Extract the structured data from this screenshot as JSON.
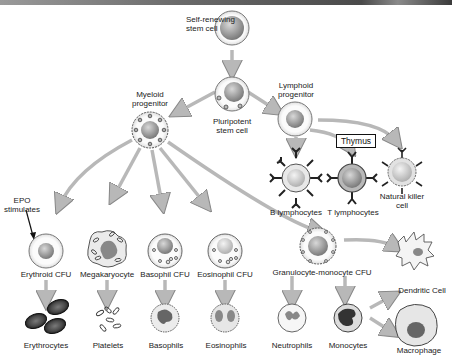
{
  "diagram": {
    "nodes": {
      "self_renewing": "Self-renewing\nstem cell",
      "pluripotent": "Pluripotent\nstem cell",
      "myeloid": "Myeloid\nprogenitor",
      "lymphoid": "Lymphoid\nprogenitor",
      "thymus": "Thymus",
      "b_lymph": "B lymphocytes",
      "t_lymph": "T lymphocytes",
      "nk": "Natural killer\ncell",
      "epo": "EPO\nstimulates",
      "erythroid_cfu": "Erythroid CFU",
      "megakaryocyte": "Megakaryocyte",
      "basophil_cfu": "Basophil CFU",
      "eosinophil_cfu": "Eosinophil CFU",
      "gm_cfu": "Granulocyte-monocyte CFU",
      "dendritic": "Dendritic Cell",
      "macrophage": "Macrophage",
      "erythrocytes": "Erythrocytes",
      "platelets": "Platelets",
      "basophils": "Basophils",
      "eosinophils": "Eosinophils",
      "neutrophils": "Neutrophils",
      "monocytes": "Monocytes"
    },
    "labels_split": {
      "self_renewing": [
        "Self-renewing",
        "stem cell"
      ],
      "pluripotent": [
        "Pluripotent",
        "stem cell"
      ],
      "myeloid": [
        "Myeloid",
        "progenitor"
      ],
      "lymphoid": [
        "Lymphoid",
        "progenitor"
      ],
      "nk": [
        "Natural killer",
        "cell"
      ],
      "epo": [
        "EPO",
        "stimulates"
      ]
    },
    "colors": {
      "arrow": "#b0b0b0",
      "cell_membrane": "#f2f2f2",
      "nucleus": "#8a8a8a",
      "rbc": "#3a3a3a"
    }
  }
}
